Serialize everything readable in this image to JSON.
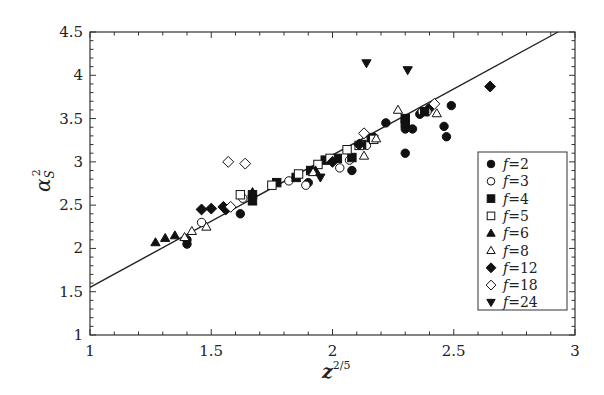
{
  "chart_data": {
    "type": "scatter",
    "title": "",
    "xlabel": "z^(2/5)",
    "ylabel": "α_S^2",
    "xlim": [
      1,
      3
    ],
    "ylim": [
      1,
      4.5
    ],
    "xticks": [
      1,
      1.5,
      2,
      2.5,
      3
    ],
    "xtick_labels": [
      "1",
      "1.5",
      "2",
      "2.5",
      "3"
    ],
    "yticks": [
      1,
      1.5,
      2,
      2.5,
      3,
      3.5,
      4,
      4.5
    ],
    "ytick_labels": [
      "1",
      "1.5",
      "2",
      "2.5",
      "3",
      "3.5",
      "4",
      "4.5"
    ],
    "grid": false,
    "legend_position": "lower right (inside)",
    "fit_line": {
      "x": [
        1,
        2.93
      ],
      "y": [
        1.55,
        4.5
      ],
      "label": "linear fit"
    },
    "series": [
      {
        "name": "f=2",
        "marker": "filled-circle",
        "points": [
          [
            1.4,
            2.05
          ],
          [
            1.4,
            2.1
          ],
          [
            1.62,
            2.4
          ],
          [
            1.9,
            2.76
          ],
          [
            2.08,
            2.9
          ],
          [
            2.22,
            3.45
          ],
          [
            2.3,
            3.38
          ],
          [
            2.33,
            3.38
          ],
          [
            2.36,
            3.55
          ],
          [
            2.4,
            3.62
          ],
          [
            2.46,
            3.41
          ],
          [
            2.49,
            3.65
          ],
          [
            2.47,
            3.29
          ],
          [
            2.3,
            3.1
          ]
        ]
      },
      {
        "name": "f=3",
        "marker": "open-circle",
        "points": [
          [
            1.46,
            2.3
          ],
          [
            1.63,
            2.58
          ],
          [
            1.82,
            2.78
          ],
          [
            1.89,
            2.73
          ],
          [
            2.03,
            2.93
          ],
          [
            2.07,
            3.02
          ],
          [
            2.14,
            3.19
          ],
          [
            2.37,
            3.58
          ],
          [
            2.39,
            3.58
          ]
        ]
      },
      {
        "name": "f=4",
        "marker": "filled-square",
        "points": [
          [
            1.67,
            2.55
          ],
          [
            1.67,
            2.62
          ],
          [
            1.77,
            2.76
          ],
          [
            1.85,
            2.82
          ],
          [
            1.91,
            2.9
          ],
          [
            1.97,
            3.02
          ],
          [
            2.02,
            3.04
          ],
          [
            2.08,
            3.05
          ],
          [
            2.12,
            3.2
          ],
          [
            2.16,
            3.28
          ],
          [
            2.3,
            3.5
          ],
          [
            2.3,
            3.45
          ],
          [
            2.38,
            3.58
          ]
        ]
      },
      {
        "name": "f=5",
        "marker": "open-square",
        "points": [
          [
            1.62,
            2.62
          ],
          [
            1.75,
            2.73
          ],
          [
            1.86,
            2.86
          ],
          [
            1.94,
            2.97
          ],
          [
            1.99,
            3.04
          ],
          [
            2.06,
            3.14
          ],
          [
            2.11,
            3.19
          ],
          [
            2.17,
            3.26
          ]
        ]
      },
      {
        "name": "f=6",
        "marker": "filled-triangle-up",
        "points": [
          [
            1.27,
            2.07
          ],
          [
            1.31,
            2.12
          ],
          [
            1.35,
            2.15
          ],
          [
            1.67,
            2.65
          ],
          [
            1.93,
            2.9
          ]
        ]
      },
      {
        "name": "f=8",
        "marker": "open-triangle-up",
        "points": [
          [
            1.39,
            2.13
          ],
          [
            1.42,
            2.2
          ],
          [
            1.48,
            2.25
          ],
          [
            1.92,
            2.88
          ],
          [
            2.13,
            3.07
          ],
          [
            2.18,
            3.27
          ],
          [
            2.27,
            3.6
          ],
          [
            2.43,
            3.56
          ]
        ]
      },
      {
        "name": "f=12",
        "marker": "filled-diamond",
        "points": [
          [
            1.46,
            2.45
          ],
          [
            1.5,
            2.46
          ],
          [
            1.55,
            2.48
          ],
          [
            1.56,
            2.45
          ],
          [
            2.0,
            3.0
          ],
          [
            2.11,
            3.2
          ],
          [
            2.65,
            3.87
          ]
        ]
      },
      {
        "name": "f=18",
        "marker": "open-diamond",
        "points": [
          [
            1.57,
            3.0
          ],
          [
            1.64,
            2.98
          ],
          [
            2.13,
            3.33
          ],
          [
            2.42,
            3.67
          ],
          [
            1.58,
            2.48
          ]
        ]
      },
      {
        "name": "f=24",
        "marker": "filled-triangle-down",
        "points": [
          [
            1.95,
            2.82
          ],
          [
            2.14,
            4.14
          ],
          [
            2.31,
            4.06
          ]
        ]
      }
    ]
  }
}
